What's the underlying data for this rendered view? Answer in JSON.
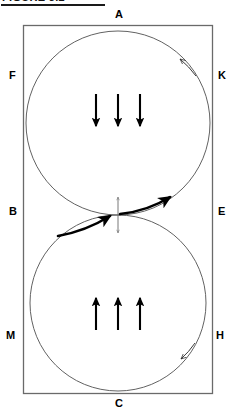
{
  "heading": {
    "text": "FIGURE 3.2",
    "underlined": true,
    "clipped": true
  },
  "diagram": {
    "boundary": {
      "shape": "rectangle",
      "stroke_color": "#555555",
      "x": 23,
      "y": 25,
      "width": 189,
      "height": 368
    },
    "labels": [
      {
        "id": "A",
        "text": "A",
        "x": 115,
        "y": 9,
        "position": "top-center"
      },
      {
        "id": "F",
        "text": "F",
        "x": 9,
        "y": 70,
        "position": "left-upper"
      },
      {
        "id": "K",
        "text": "K",
        "x": 218,
        "y": 70,
        "position": "right-upper"
      },
      {
        "id": "B",
        "text": "B",
        "x": 9,
        "y": 206,
        "position": "left-middle"
      },
      {
        "id": "E",
        "text": "E",
        "x": 218,
        "y": 206,
        "position": "right-middle"
      },
      {
        "id": "M",
        "text": "M",
        "x": 7,
        "y": 330,
        "position": "left-lower"
      },
      {
        "id": "H",
        "text": "H",
        "x": 217,
        "y": 330,
        "position": "right-lower"
      },
      {
        "id": "C",
        "text": "C",
        "x": 115,
        "y": 398,
        "position": "bottom-center"
      }
    ],
    "circles": [
      {
        "id": "upper-circle",
        "cx": 118,
        "cy": 123,
        "r": 92,
        "stroke_color": "#4a4a4a",
        "circulation": "counter-clockwise",
        "arrowhead_angle_deg": -45
      },
      {
        "id": "lower-circle",
        "cx": 118,
        "cy": 303,
        "r": 88,
        "stroke_color": "#4a4a4a",
        "circulation": "counter-clockwise",
        "arrowhead_angle_deg": 45
      }
    ],
    "interior_arrows": {
      "upper": {
        "direction": "down",
        "count": 3,
        "color": "#000000",
        "xs": [
          96,
          118,
          140
        ],
        "y_top": 94,
        "y_bottom": 128
      },
      "lower": {
        "direction": "up",
        "count": 3,
        "color": "#000000",
        "xs": [
          96,
          118,
          140
        ],
        "y_top": 296,
        "y_bottom": 330
      }
    },
    "tangent_point": {
      "x": 118,
      "y": 215,
      "marker": "vertical-double-arrow",
      "marker_half_height": 18
    },
    "bold_tangent_arrows": [
      {
        "id": "left-bold-arrow",
        "from_x": 60,
        "from_y": 233,
        "to_x": 112,
        "to_y": 216,
        "direction": "up-right"
      },
      {
        "id": "right-bold-arrow",
        "from_x": 120,
        "from_y": 215,
        "to_x": 172,
        "to_y": 198,
        "direction": "up-right"
      }
    ]
  },
  "colors": {
    "stroke": "#4a4a4a",
    "boundary": "#555555",
    "arrow": "#000000",
    "background": "#ffffff"
  }
}
